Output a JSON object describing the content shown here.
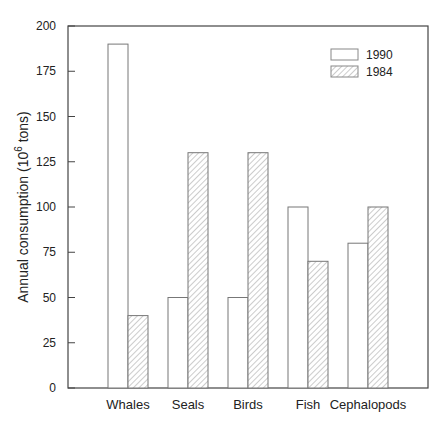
{
  "chart_data": {
    "type": "bar",
    "title": "",
    "xlabel": "",
    "ylabel": "Annual consumption (10^6 tons)",
    "ylabel_main": "Annual consumption (10",
    "ylabel_sup": "6",
    "ylabel_tail": " tons)",
    "categories": [
      "Whales",
      "Seals",
      "Birds",
      "Fish",
      "Cephalopods"
    ],
    "series": [
      {
        "name": "1990",
        "fill": "plain",
        "values": [
          190,
          50,
          50,
          100,
          80
        ]
      },
      {
        "name": "1984",
        "fill": "hatched",
        "values": [
          40,
          130,
          130,
          70,
          100
        ]
      }
    ],
    "ylim": [
      0,
      200
    ],
    "yticks": [
      0,
      25,
      50,
      75,
      100,
      125,
      150,
      175,
      200
    ],
    "grid": false,
    "legend_position": "upper right"
  }
}
